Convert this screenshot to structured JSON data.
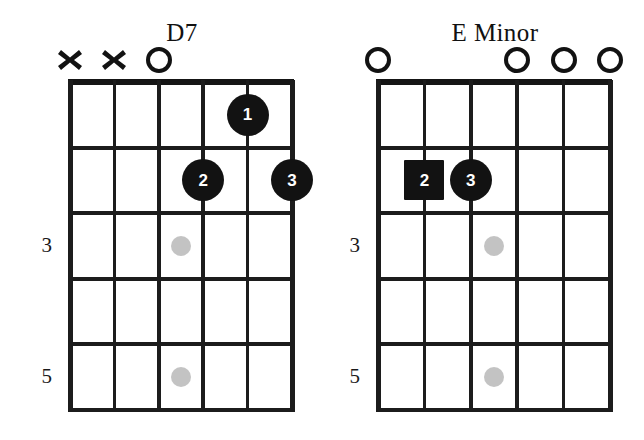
{
  "page": {
    "background_color": "#ffffff",
    "ink_color": "#121212",
    "inlay_color": "#b8b8b8",
    "width": 644,
    "height": 440
  },
  "diagrams": [
    {
      "id": "d7",
      "name": "D7",
      "title": "D7",
      "strings": 6,
      "frets": 5,
      "geometry": {
        "left": 70,
        "top": 82,
        "width": 222,
        "height": 328,
        "string_spacing": 44.4,
        "fret_spacing": 65.6
      },
      "title_position": {
        "center_x": 182,
        "top": 20
      },
      "string_indicators": [
        {
          "string": 0,
          "type": "mute",
          "symbol": "x",
          "label": "muted-string"
        },
        {
          "string": 1,
          "type": "mute",
          "symbol": "x",
          "label": "muted-string"
        },
        {
          "string": 2,
          "type": "open",
          "symbol": "o",
          "label": "open-string"
        },
        {
          "string": 3,
          "type": "none",
          "symbol": "",
          "label": "fretted-string"
        },
        {
          "string": 4,
          "type": "none",
          "symbol": "",
          "label": "fretted-string"
        },
        {
          "string": 5,
          "type": "none",
          "symbol": "",
          "label": "fretted-string"
        }
      ],
      "finger_markers": [
        {
          "finger": "1",
          "string": 4,
          "fret": 1,
          "shape": "circle",
          "size": 42
        },
        {
          "finger": "2",
          "string": 3,
          "fret": 2,
          "shape": "circle",
          "size": 42
        },
        {
          "finger": "3",
          "string": 5,
          "fret": 2,
          "shape": "circle",
          "size": 42
        }
      ],
      "inlay_dots": [
        {
          "fret": 3,
          "between_strings": [
            2,
            3
          ],
          "size": 20
        },
        {
          "fret": 5,
          "between_strings": [
            2,
            3
          ],
          "size": 20
        }
      ],
      "fret_numbers": [
        {
          "label": "3",
          "fret": 3
        },
        {
          "label": "5",
          "fret": 5
        }
      ]
    },
    {
      "id": "e-minor",
      "name": "E Minor",
      "title": "E Minor",
      "strings": 6,
      "frets": 5,
      "geometry": {
        "left": 378,
        "top": 82,
        "width": 232,
        "height": 328,
        "string_spacing": 46.4,
        "fret_spacing": 65.6
      },
      "title_position": {
        "center_x": 495,
        "top": 20
      },
      "string_indicators": [
        {
          "string": 0,
          "type": "open",
          "symbol": "o",
          "label": "open-string"
        },
        {
          "string": 1,
          "type": "none",
          "symbol": "",
          "label": "fretted-string"
        },
        {
          "string": 2,
          "type": "none",
          "symbol": "",
          "label": "fretted-string"
        },
        {
          "string": 3,
          "type": "open",
          "symbol": "o",
          "label": "open-string"
        },
        {
          "string": 4,
          "type": "open",
          "symbol": "o",
          "label": "open-string"
        },
        {
          "string": 5,
          "type": "open",
          "symbol": "o",
          "label": "open-string"
        }
      ],
      "finger_markers": [
        {
          "finger": "2",
          "string": 1,
          "fret": 2,
          "shape": "square",
          "size": 40
        },
        {
          "finger": "3",
          "string": 2,
          "fret": 2,
          "shape": "circle",
          "size": 42
        }
      ],
      "inlay_dots": [
        {
          "fret": 3,
          "between_strings": [
            2,
            3
          ],
          "size": 20
        },
        {
          "fret": 5,
          "between_strings": [
            2,
            3
          ],
          "size": 20
        }
      ],
      "fret_numbers": [
        {
          "label": "3",
          "fret": 3
        },
        {
          "label": "5",
          "fret": 5
        }
      ]
    }
  ]
}
